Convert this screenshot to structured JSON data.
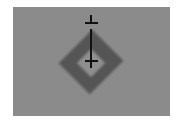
{
  "figure": {
    "colors": {
      "background": "#ffffff",
      "field": "#8b8b8b",
      "diamond": "#555555",
      "diamond_center": "#8e8e8e",
      "marker": "#111111"
    }
  }
}
